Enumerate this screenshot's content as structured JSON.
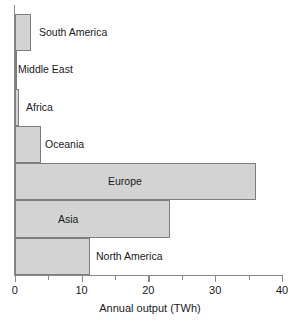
{
  "chart_data": {
    "type": "bar",
    "orientation": "horizontal",
    "title": "",
    "subtitle": "",
    "xlabel": "Annual output (TWh)",
    "ylabel": "",
    "xlim": [
      0,
      40
    ],
    "grid": false,
    "legend": null,
    "x_major_ticks": [
      0,
      10,
      20,
      30,
      40
    ],
    "x_minor_ticks": [
      5,
      15,
      25,
      35
    ],
    "x_tick_labels": [
      "0",
      "10",
      "20",
      "30",
      "40"
    ],
    "categories": [
      "South America",
      "Middle East",
      "Africa",
      "Oceania",
      "Europe",
      "Asia",
      "North America"
    ],
    "values": [
      2.5,
      0.1,
      0.7,
      3.9,
      36.1,
      23.3,
      11.3
    ],
    "bar_fill_color": "#d3d3d3",
    "bar_edge_color": "#7d7d7d",
    "axis_color": "#8a8a8a",
    "text_color": "#1a1a1a"
  }
}
